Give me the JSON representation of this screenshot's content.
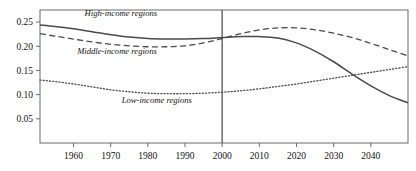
{
  "chart_data": {
    "type": "line",
    "title": "",
    "xlabel": "",
    "ylabel": "",
    "xlim": [
      1951,
      2050
    ],
    "ylim": [
      0.0,
      0.275
    ],
    "grid": false,
    "legend_position": "inline-annotations",
    "x_ticks": [
      "1960",
      "1970",
      "1980",
      "1990",
      "2000",
      "2010",
      "2020",
      "2030",
      "2040"
    ],
    "x_tick_values": [
      1960,
      1970,
      1980,
      1990,
      2000,
      2010,
      2020,
      2030,
      2040
    ],
    "y_ticks": [
      "0.05",
      "0.10",
      "0.15",
      "0.20",
      "0.25"
    ],
    "y_tick_values": [
      0.05,
      0.1,
      0.15,
      0.2,
      0.25
    ],
    "annotations": [
      {
        "text": "High-income regions",
        "x": 1963,
        "y": 0.262
      },
      {
        "text": "Middle-income regions",
        "x": 1961,
        "y": 0.185
      },
      {
        "text": "Low-income regions",
        "x": 1973,
        "y": 0.082
      }
    ],
    "reference_lines": [
      {
        "orientation": "vertical",
        "value": 2000,
        "style": "solid",
        "color": "#555555"
      }
    ],
    "series": [
      {
        "name": "High-income regions",
        "style": "solid",
        "color": "#4a4a4a",
        "x": [
          1951,
          1955,
          1960,
          1965,
          1970,
          1975,
          1980,
          1985,
          1990,
          1995,
          2000,
          2005,
          2010,
          2015,
          2020,
          2025,
          2030,
          2035,
          2040,
          2045,
          2050
        ],
        "values": [
          0.244,
          0.241,
          0.236,
          0.23,
          0.224,
          0.219,
          0.216,
          0.215,
          0.215,
          0.216,
          0.218,
          0.22,
          0.22,
          0.217,
          0.207,
          0.19,
          0.168,
          0.142,
          0.118,
          0.098,
          0.083
        ]
      },
      {
        "name": "Middle-income regions",
        "style": "dashed",
        "color": "#4a4a4a",
        "x": [
          1951,
          1955,
          1960,
          1965,
          1970,
          1975,
          1980,
          1985,
          1990,
          1995,
          2000,
          2005,
          2010,
          2015,
          2020,
          2025,
          2030,
          2035,
          2040,
          2045,
          2050
        ],
        "values": [
          0.226,
          0.221,
          0.215,
          0.209,
          0.204,
          0.201,
          0.199,
          0.199,
          0.201,
          0.207,
          0.216,
          0.226,
          0.234,
          0.238,
          0.238,
          0.234,
          0.227,
          0.218,
          0.206,
          0.193,
          0.18
        ]
      },
      {
        "name": "Low-income regions",
        "style": "dotted",
        "color": "#4a4a4a",
        "x": [
          1951,
          1955,
          1960,
          1965,
          1970,
          1975,
          1980,
          1985,
          1990,
          1995,
          2000,
          2005,
          2010,
          2015,
          2020,
          2025,
          2030,
          2035,
          2040,
          2045,
          2050
        ],
        "values": [
          0.13,
          0.127,
          0.122,
          0.116,
          0.11,
          0.106,
          0.103,
          0.102,
          0.102,
          0.103,
          0.105,
          0.108,
          0.112,
          0.117,
          0.122,
          0.128,
          0.134,
          0.14,
          0.146,
          0.152,
          0.158
        ]
      }
    ]
  }
}
